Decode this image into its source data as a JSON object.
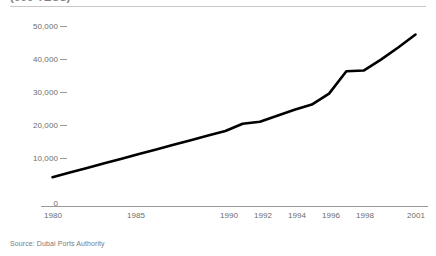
{
  "title": "(000 TEUs)",
  "source_note": "Source: Dubai Ports Authority",
  "axis": {
    "y_ticks": [
      "0",
      "10,000",
      "20,000",
      "30,000",
      "40,000",
      "50,000"
    ],
    "x_ticks": [
      "1980",
      "1985",
      "1990",
      "1992",
      "1994",
      "1996",
      "1998",
      "2001"
    ]
  },
  "colors": {
    "line": "#000000",
    "axis": "#999999",
    "tick_text": "#6d6d6d",
    "rule": "#c8c8c8"
  },
  "chart_data": {
    "type": "line",
    "title": "(000 TEUs)",
    "xlabel": "",
    "ylabel": "",
    "xlim": [
      1980,
      2001
    ],
    "ylim": [
      0,
      50000
    ],
    "ytick_values": [
      0,
      10000,
      20000,
      30000,
      40000,
      50000
    ],
    "ytick_labels": [
      "0",
      "10,000",
      "20,000",
      "30,000",
      "40,000",
      "50,000"
    ],
    "xtick_values": [
      1980,
      1985,
      1990,
      1992,
      1994,
      1996,
      1998,
      2001
    ],
    "xtick_labels": [
      "1980",
      "1985",
      "1990",
      "1992",
      "1994",
      "1996",
      "1998",
      "2001"
    ],
    "grid": false,
    "legend": null,
    "series": [
      {
        "name": "Dubai Ports throughput",
        "x": [
          1980,
          1981,
          1982,
          1983,
          1984,
          1985,
          1986,
          1987,
          1988,
          1989,
          1990,
          1991,
          1992,
          1993,
          1994,
          1995,
          1996,
          1997,
          1998,
          1999,
          2000,
          2001
        ],
        "values": [
          4200,
          5600,
          7000,
          8400,
          9800,
          11200,
          12600,
          14000,
          15400,
          16800,
          18200,
          20400,
          21000,
          22800,
          24600,
          26200,
          29500,
          36300,
          36500,
          39800,
          43500,
          47400
        ]
      }
    ]
  }
}
